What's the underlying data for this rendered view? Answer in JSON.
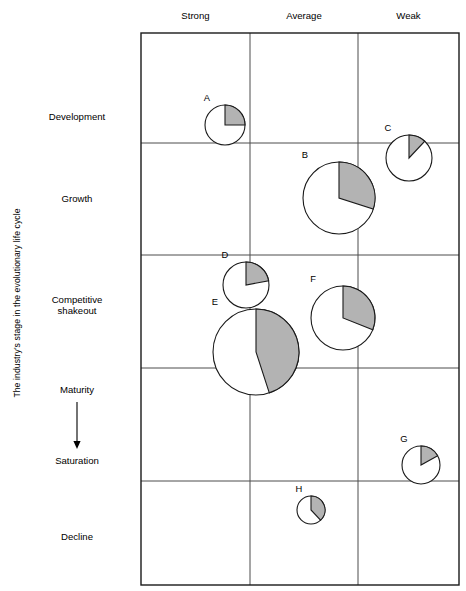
{
  "axes": {
    "y_title": "The industry's stage in the evolutionary life cycle",
    "x_title": ""
  },
  "columns": [
    {
      "label": "Strong",
      "cx": 195.5
    },
    {
      "label": "Average",
      "cx": 304.0
    },
    {
      "label": "Weak",
      "cx": 408.5
    }
  ],
  "rows": [
    {
      "label": "Development",
      "cy": 117,
      "arrow": false
    },
    {
      "label": "Growth",
      "cy": 199,
      "arrow": false
    },
    {
      "label": "Competitive\nshakeout",
      "cy": 305,
      "arrow": false
    },
    {
      "label": "Maturity",
      "cy": 390,
      "arrow": true
    },
    {
      "label": "Saturation",
      "cy": 461,
      "arrow": false
    },
    {
      "label": "Decline",
      "cy": 537,
      "arrow": false
    }
  ],
  "style": {
    "slice_fill": "#b3b3b3",
    "circle_fill": "#ffffff",
    "stroke": "#1a1a1a",
    "grid_stroke": "#4d4d4d",
    "frame_stroke": "#1a1a1a"
  },
  "chart_data": {
    "type": "pie",
    "title": "",
    "xlabel": "",
    "ylabel": "The industry's stage in the evolutionary life cycle",
    "x_categories": [
      "Strong",
      "Average",
      "Weak"
    ],
    "y_categories": [
      "Development",
      "Growth",
      "Competitive shakeout",
      "Maturity",
      "Saturation",
      "Decline"
    ],
    "grid": true,
    "legend": "none",
    "note": "Bubble/pie matrix: each circle is a business unit positioned by competitive position (x) and industry life-cycle stage (y); circle area = business size; shaded wedge = market share.",
    "plot_frame": {
      "x0": 141,
      "y0": 33,
      "x1": 459,
      "y1": 585
    },
    "vertical_gridlines": [
      250,
      358
    ],
    "horizontal_gridlines": [
      143,
      255,
      368,
      481
    ],
    "bubbles": [
      {
        "label": "A",
        "cx": 225,
        "cy": 125,
        "r": 20,
        "share_pct": 25,
        "column": "Strong",
        "row": "Development"
      },
      {
        "label": "B",
        "cx": 339,
        "cy": 198,
        "r": 36,
        "share_pct": 30,
        "column": "Average",
        "row": "Growth"
      },
      {
        "label": "C",
        "cx": 409,
        "cy": 158,
        "r": 23,
        "share_pct": 12,
        "column": "Weak",
        "row": "Growth"
      },
      {
        "label": "D",
        "cx": 246,
        "cy": 285,
        "r": 23,
        "share_pct": 22,
        "column": "Strong",
        "row": "Competitive shakeout"
      },
      {
        "label": "E",
        "cx": 256,
        "cy": 352,
        "r": 43,
        "share_pct": 45,
        "column": "Strong",
        "row": "Competitive shakeout"
      },
      {
        "label": "F",
        "cx": 343,
        "cy": 318,
        "r": 32,
        "share_pct": 31,
        "column": "Average",
        "row": "Competitive shakeout"
      },
      {
        "label": "G",
        "cx": 421,
        "cy": 465,
        "r": 19,
        "share_pct": 17,
        "column": "Weak",
        "row": "Saturation"
      },
      {
        "label": "H",
        "cx": 311,
        "cy": 510,
        "r": 14,
        "share_pct": 38,
        "column": "Average",
        "row": "Decline"
      }
    ]
  }
}
